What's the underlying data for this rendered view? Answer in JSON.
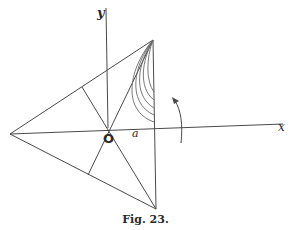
{
  "figure": {
    "caption": "Fig. 23.",
    "labels": {
      "y_axis": "y",
      "x_axis": "x",
      "point_a": "a",
      "origin": "O"
    },
    "colors": {
      "line": "#4a4a4a",
      "curve": "#6a6a6a",
      "text": "#2a2a2a",
      "background": "#ffffff"
    },
    "vertices": {
      "left": [
        10,
        134
      ],
      "top": [
        153,
        40
      ],
      "bottom": [
        156,
        209
      ],
      "origin": [
        108,
        128
      ]
    },
    "feet_of_perpendiculars": {
      "upper_left_edge": [
        82,
        87
      ],
      "lower_left_edge": [
        88,
        175
      ]
    },
    "axes": {
      "x_axis": {
        "from": [
          10,
          134
        ],
        "to": [
          283,
          124
        ]
      },
      "y_axis": {
        "from": [
          106,
          8
        ],
        "to": [
          108,
          128
        ]
      }
    },
    "flow_curves_count": 5,
    "rotation_arrow": "counter-clockwise"
  }
}
